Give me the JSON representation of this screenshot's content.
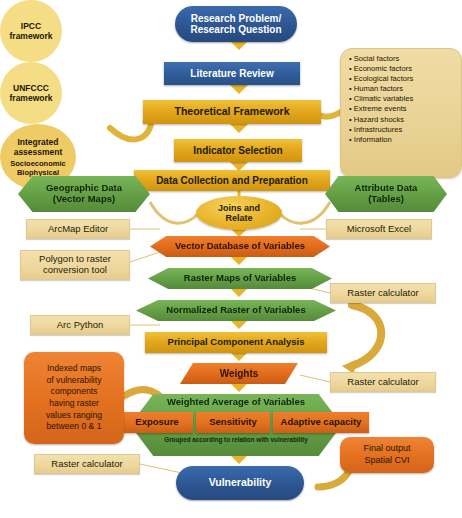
{
  "nodes": {
    "research_problem": "Research Problem/\nResearch Question",
    "literature_review": "Literature Review",
    "theoretical_framework": "Theoretical Framework",
    "indicator_selection": "Indicator Selection",
    "data_collection": "Data Collection and Preparation",
    "joins_and_relate": "Joins and\nRelate",
    "geographic_data": "Geographic Data\n(Vector Maps)",
    "attribute_data": "Attribute Data\n(Tables)",
    "vector_database": "Vector Database of Variables",
    "raster_maps": "Raster Maps of Variables",
    "normalized_raster": "Normalized Raster of Variables",
    "pca": "Principal Component Analysis",
    "weights": "Weights",
    "weighted_average": "Weighted Average of Variables",
    "vulnerability": "Vulnerability"
  },
  "framework_circles": {
    "ipcc": "IPCC\nframework",
    "unfccc": "UNFCCC\nframework",
    "integrated": "Integrated\nassessment",
    "integrated_bullets": [
      "Socioeconomic",
      "Biophysical"
    ]
  },
  "factors": {
    "items": [
      "Social factors",
      "Economic factors",
      "Ecological factors",
      "Human factors",
      "Climatic variables",
      "Extreme events",
      "Hazard shocks",
      "Infrastructures",
      "Information"
    ]
  },
  "tools": {
    "arcmap_editor": "ArcMap Editor",
    "microsoft_excel": "Microsoft Excel",
    "polygon_to_raster": "Polygon to raster\nconversion tool",
    "raster_calculator_1": "Raster calculator",
    "arc_python": "Arc Python",
    "raster_calculator_2": "Raster calculator",
    "raster_calculator_3": "Raster calculator"
  },
  "components": {
    "exposure": "Exposure",
    "sensitivity": "Sensitivity",
    "adaptive_capacity": "Adaptive capacity",
    "grouping_note": "Grouped according to relation with vulnerability"
  },
  "annotations": {
    "indexed_maps": "Indexed maps\nof vulnerability\ncomponents\nhaving raster\nvalues ranging\nbetween 0 & 1",
    "final_output": "Final output\nSpatial CVI"
  },
  "colors": {
    "blue": "#2d5591",
    "gold": "#e3a81d",
    "green": "#639e45",
    "orange": "#e06a1b",
    "tan": "#eed79d",
    "circle_yellow": "#f3da7b",
    "arrow": "#e8b42c"
  }
}
